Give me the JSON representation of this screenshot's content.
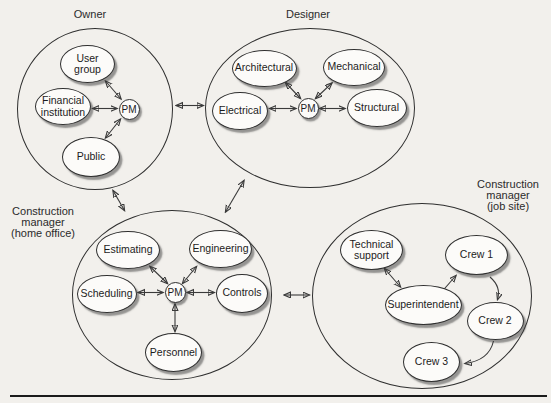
{
  "clusters": {
    "owner": {
      "label": "Owner",
      "pm_label": "PM",
      "nodes": {
        "user_group": {
          "lines": [
            "User",
            "group"
          ]
        },
        "financial_institution": {
          "lines": [
            "Financial",
            "institution"
          ]
        },
        "public": {
          "lines": [
            "Public"
          ]
        }
      }
    },
    "designer": {
      "label": "Designer",
      "pm_label": "PM",
      "nodes": {
        "architectural": {
          "lines": [
            "Architectural"
          ]
        },
        "mechanical": {
          "lines": [
            "Mechanical"
          ]
        },
        "electrical": {
          "lines": [
            "Electrical"
          ]
        },
        "structural": {
          "lines": [
            "Structural"
          ]
        }
      }
    },
    "home_office": {
      "label_lines": [
        "Construction",
        "manager",
        "(home office)"
      ],
      "pm_label": "PM",
      "nodes": {
        "estimating": {
          "lines": [
            "Estimating"
          ]
        },
        "engineering": {
          "lines": [
            "Engineering"
          ]
        },
        "scheduling": {
          "lines": [
            "Scheduling"
          ]
        },
        "controls": {
          "lines": [
            "Controls"
          ]
        },
        "personnel": {
          "lines": [
            "Personnel"
          ]
        }
      }
    },
    "job_site": {
      "label_lines": [
        "Construction",
        "manager",
        "(job site)"
      ],
      "nodes": {
        "technical_support": {
          "lines": [
            "Technical",
            "support"
          ]
        },
        "superintendent": {
          "lines": [
            "Superintendent"
          ]
        },
        "crew_1": {
          "lines": [
            "Crew 1"
          ]
        },
        "crew_2": {
          "lines": [
            "Crew 2"
          ]
        },
        "crew_3": {
          "lines": [
            "Crew 3"
          ]
        }
      }
    }
  },
  "edges": [
    {
      "from": "user-group",
      "to": "pm-owner",
      "bidirectional": true
    },
    {
      "from": "financial-institution",
      "to": "pm-owner",
      "bidirectional": true
    },
    {
      "from": "public",
      "to": "pm-owner",
      "bidirectional": true
    },
    {
      "from": "architectural",
      "to": "pm-designer",
      "bidirectional": true
    },
    {
      "from": "mechanical",
      "to": "pm-designer",
      "bidirectional": true
    },
    {
      "from": "electrical",
      "to": "pm-designer",
      "bidirectional": true
    },
    {
      "from": "structural",
      "to": "pm-designer",
      "bidirectional": true
    },
    {
      "from": "estimating",
      "to": "pm-home-office",
      "bidirectional": true
    },
    {
      "from": "engineering",
      "to": "pm-home-office",
      "bidirectional": true
    },
    {
      "from": "scheduling",
      "to": "pm-home-office",
      "bidirectional": true
    },
    {
      "from": "controls",
      "to": "pm-home-office",
      "bidirectional": true
    },
    {
      "from": "personnel",
      "to": "pm-home-office",
      "bidirectional": true
    },
    {
      "from": "technical-support",
      "to": "superintendent",
      "bidirectional": true
    },
    {
      "from": "superintendent",
      "to": "crew-1",
      "bidirectional": false
    },
    {
      "from": "crew-1",
      "to": "crew-2",
      "bidirectional": false
    },
    {
      "from": "crew-2",
      "to": "crew-3",
      "bidirectional": false
    },
    {
      "from": "owner",
      "to": "designer",
      "bidirectional": true
    },
    {
      "from": "owner",
      "to": "home-office",
      "bidirectional": true
    },
    {
      "from": "designer",
      "to": "home-office",
      "bidirectional": true
    },
    {
      "from": "home-office",
      "to": "job-site",
      "bidirectional": true
    }
  ],
  "colors": {
    "background": "#f2f0ec",
    "node_fill": "#fcfbf9",
    "stroke": "#2f2f2f",
    "text": "#1c1c1c",
    "shadow_rgba": "rgba(55,55,55,0.5)"
  }
}
